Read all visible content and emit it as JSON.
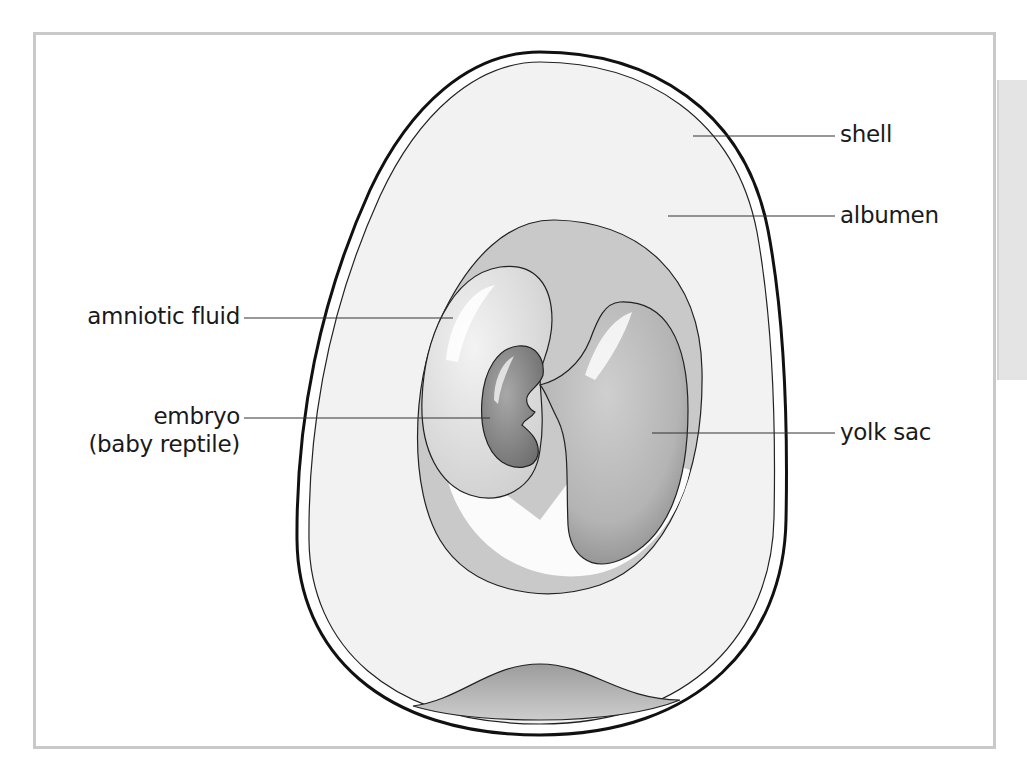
{
  "figure": {
    "colors": {
      "frame_border": "#c9c9c9",
      "side_tab": "#e4e4e4",
      "shell_stroke": "#111111",
      "albumen_fill": "#f2f2f2",
      "chorion_fill": "#c8c8c8",
      "amnion_fill": "#d9d9d9",
      "embryo_fill": "#8f8f8f",
      "yolk_fill": "#b5b5b5",
      "air_space_fill": "#a9a9a9",
      "leader_line": "#333333",
      "label_text": "#1a1a1a"
    }
  },
  "labels": {
    "shell": "shell",
    "albumen": "albumen",
    "amniotic_fluid": "amniotic fluid",
    "embryo_line1": "embryo",
    "embryo_line2": "(baby reptile)",
    "yolk_sac": "yolk sac"
  }
}
